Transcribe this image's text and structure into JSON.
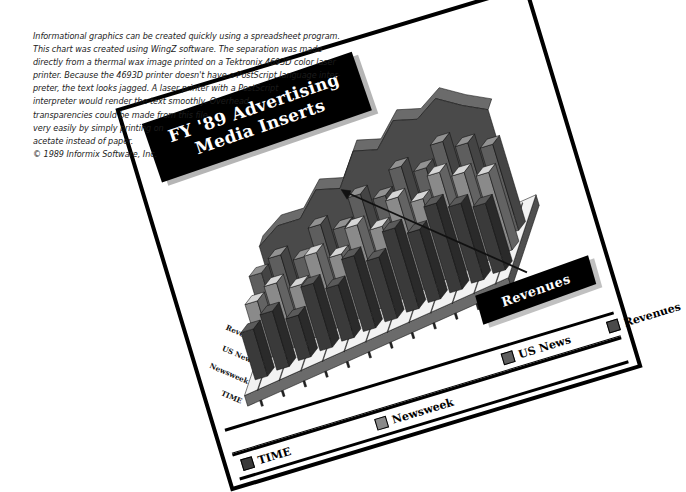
{
  "caption": {
    "lines": [
      "Informational graphics can be created quickly using a spreadsheet program.",
      "This chart was created using WingZ software.  The separation was made",
      "directly from a thermal wax image printed on a Tektronix 4693D color laser",
      "printer. Because the 4693D printer doesn't have a PostScript language inter-",
      "preter, the text  looks jagged. A laser printer with a PostScript",
      "interpreter would render the text smoothly.   Overhead",
      "transparencies could be made from this file",
      "very easily by simply printing on",
      "acetate instead of paper.",
      "© 1989 Informix Software, Inc."
    ]
  },
  "chart_card": {
    "title_line1": "FY '89 Advertising",
    "title_line2": "Media Inserts",
    "callout_label": "Revenues"
  },
  "legend": {
    "items": [
      {
        "label": "TIME",
        "color": "#3a3a3a"
      },
      {
        "label": "Newsweek",
        "color": "#8a8a8a"
      },
      {
        "label": "US News",
        "color": "#5e5e5e"
      },
      {
        "label": "Revenues",
        "color": "#4a4a4a"
      }
    ]
  },
  "chart_data": {
    "type": "bar",
    "title": "FY '89 Advertising Media Inserts",
    "subtitle": "",
    "xlabel": "TIME",
    "ylabel": "",
    "zlabel": "",
    "grid": false,
    "legend_position": "bottom",
    "projection": "3d",
    "depth_axis_labels": [
      "Revenues",
      "US News",
      "Newsweek",
      "TIME"
    ],
    "categories": [
      "1",
      "2",
      "3",
      "4",
      "5",
      "6",
      "7",
      "8",
      "9",
      "10",
      "11",
      "12"
    ],
    "ylim": [
      0,
      100
    ],
    "series": [
      {
        "name": "TIME",
        "color": "#3a3a3a",
        "render": "bar",
        "values": [
          34,
          40,
          30,
          46,
          38,
          52,
          44,
          58,
          50,
          62,
          55,
          48
        ]
      },
      {
        "name": "Newsweek",
        "color": "#8a8a8a",
        "render": "bar",
        "values": [
          40,
          46,
          38,
          54,
          46,
          60,
          52,
          66,
          58,
          70,
          63,
          56
        ]
      },
      {
        "name": "US News",
        "color": "#5e5e5e",
        "render": "bar",
        "values": [
          46,
          52,
          44,
          60,
          52,
          68,
          60,
          74,
          66,
          78,
          70,
          62
        ]
      },
      {
        "name": "Revenues",
        "color": "#4a4a4a",
        "render": "area",
        "values": [
          52,
          60,
          58,
          72,
          66,
          86,
          80,
          94,
          88,
          96,
          84,
          74
        ]
      }
    ]
  }
}
